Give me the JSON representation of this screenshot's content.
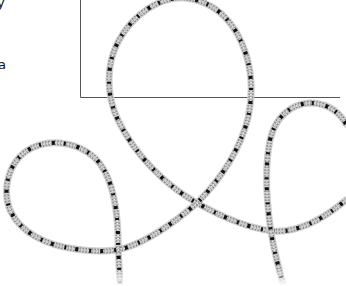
{
  "image": {
    "description": "Illustration of a speckled grey rope forming loops over a thin-lined rectangular frame",
    "colors": {
      "background": "#ffffff",
      "frame_line": "#555555",
      "rope_base": "#b5b5b5",
      "rope_highlight": "#e6e6e6",
      "rope_fleck": "#111111"
    }
  },
  "edge_text": {
    "top_fragment": "y",
    "middle_fragment": "a"
  },
  "frame": {
    "left_x": 80,
    "top_y": 0,
    "bottom_y": 97,
    "right_x": 340
  }
}
